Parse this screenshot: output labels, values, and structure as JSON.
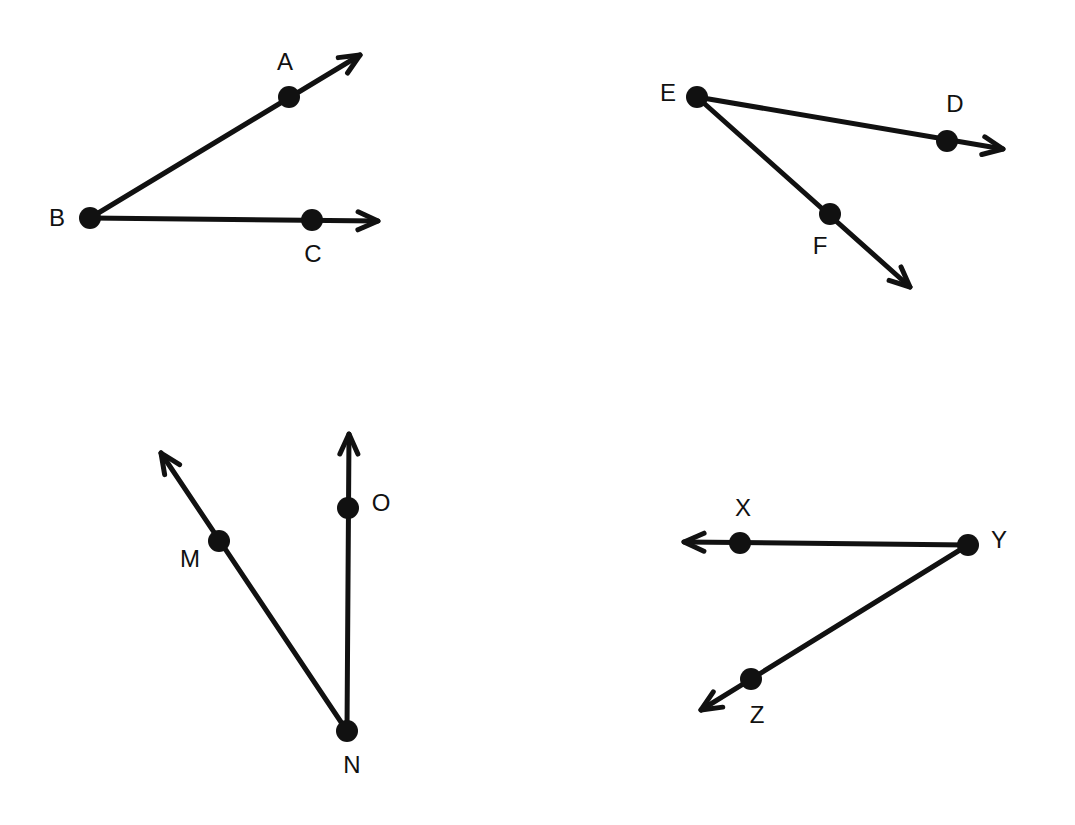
{
  "figure": {
    "background": "#ffffff",
    "stroke_color": "#111111",
    "angles": [
      {
        "name": "angle-ABC",
        "vertex": {
          "label": "B",
          "x": 90,
          "y": 218,
          "label_x": 57,
          "label_y": 220
        },
        "rays": [
          {
            "point": {
              "label": "A",
              "x": 289,
              "y": 97,
              "label_x": 285,
              "label_y": 64
            },
            "tip": {
              "x": 360,
              "y": 55
            }
          },
          {
            "point": {
              "label": "C",
              "x": 312,
              "y": 220,
              "label_x": 313,
              "label_y": 256
            },
            "tip": {
              "x": 378,
              "y": 221
            }
          }
        ]
      },
      {
        "name": "angle-DEF",
        "vertex": {
          "label": "E",
          "x": 697,
          "y": 97,
          "label_x": 668,
          "label_y": 95
        },
        "rays": [
          {
            "point": {
              "label": "D",
              "x": 947,
              "y": 141,
              "label_x": 955,
              "label_y": 106
            },
            "tip": {
              "x": 1003,
              "y": 149
            }
          },
          {
            "point": {
              "label": "F",
              "x": 830,
              "y": 214,
              "label_x": 820,
              "label_y": 248
            },
            "tip": {
              "x": 910,
              "y": 287
            }
          }
        ]
      },
      {
        "name": "angle-MNO",
        "vertex": {
          "label": "N",
          "x": 347,
          "y": 731,
          "label_x": 352,
          "label_y": 767
        },
        "rays": [
          {
            "point": {
              "label": "M",
              "x": 219,
              "y": 541,
              "label_x": 190,
              "label_y": 561
            },
            "tip": {
              "x": 161,
              "y": 453
            }
          },
          {
            "point": {
              "label": "O",
              "x": 348,
              "y": 508,
              "label_x": 381,
              "label_y": 505
            },
            "tip": {
              "x": 349,
              "y": 434
            }
          }
        ]
      },
      {
        "name": "angle-XYZ",
        "vertex": {
          "label": "Y",
          "x": 968,
          "y": 545,
          "label_x": 999,
          "label_y": 542
        },
        "rays": [
          {
            "point": {
              "label": "X",
              "x": 740,
              "y": 543,
              "label_x": 743,
              "label_y": 510
            },
            "tip": {
              "x": 684,
              "y": 542
            }
          },
          {
            "point": {
              "label": "Z",
              "x": 751,
              "y": 679,
              "label_x": 757,
              "label_y": 717
            },
            "tip": {
              "x": 701,
              "y": 710
            }
          }
        ]
      }
    ]
  }
}
